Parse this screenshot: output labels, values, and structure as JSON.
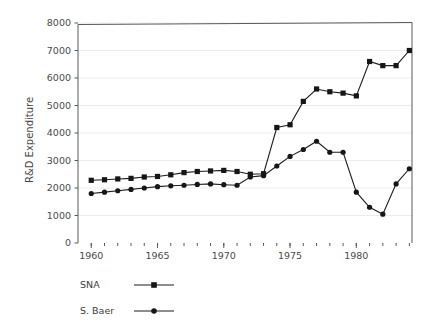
{
  "figure": {
    "background_color": "#ffffff",
    "ink_color": "#161616",
    "grid_color": "#ececec"
  },
  "chart_data": {
    "type": "line",
    "title": "",
    "xlabel": "",
    "ylabel": "R&D Expenditure",
    "xlim": [
      1959.0,
      1984.2
    ],
    "ylim": [
      0,
      8000
    ],
    "grid": true,
    "grid_axis": "y",
    "legend_position": "below-left",
    "x_major_ticks": [
      1960,
      1965,
      1970,
      1975,
      1980
    ],
    "x_major_tick_labels": [
      "1960",
      "1965",
      "1970",
      "1975",
      "1980"
    ],
    "x_minor_tick_step": 1,
    "y_ticks": [
      0,
      1000,
      2000,
      3000,
      4000,
      5000,
      6000,
      7000,
      8000
    ],
    "y_tick_labels": [
      "0",
      "1000",
      "2000",
      "3000",
      "4000",
      "5000",
      "6000",
      "7000",
      "8000"
    ],
    "x": [
      1960,
      1961,
      1962,
      1963,
      1964,
      1965,
      1966,
      1967,
      1968,
      1969,
      1970,
      1971,
      1972,
      1973,
      1974,
      1975,
      1976,
      1977,
      1978,
      1979,
      1980,
      1981,
      1982,
      1983,
      1984
    ],
    "series": [
      {
        "name": "SNA",
        "marker": "square",
        "values": [
          2280,
          2300,
          2330,
          2350,
          2400,
          2420,
          2480,
          2560,
          2600,
          2620,
          2640,
          2600,
          2500,
          2520,
          4200,
          4300,
          5150,
          5600,
          5500,
          5450,
          5350,
          6600,
          6450,
          6450,
          7000
        ]
      },
      {
        "name": "S. Baer",
        "marker": "circle",
        "values": [
          1800,
          1850,
          1900,
          1950,
          2000,
          2050,
          2080,
          2100,
          2130,
          2150,
          2120,
          2100,
          2400,
          2450,
          2800,
          3150,
          3400,
          3700,
          3300,
          3300,
          1850,
          1300,
          1050,
          2150,
          2700
        ]
      }
    ]
  },
  "legend": {
    "entries": [
      {
        "label": "SNA",
        "marker": "square"
      },
      {
        "label": "S. Baer",
        "marker": "circle"
      }
    ]
  }
}
